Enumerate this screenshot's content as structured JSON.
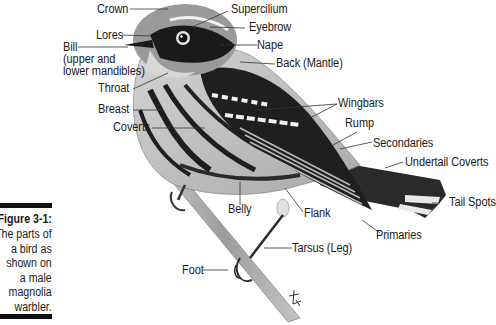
{
  "figure": {
    "caption": {
      "title": "Figure 3-1:",
      "lines": [
        "The parts of",
        "a bird as",
        "shown on",
        "a male",
        "magnolia",
        "warbler."
      ]
    },
    "subject": "male magnolia warbler",
    "labels": {
      "crown": "Crown",
      "supercilium": "Supercilium",
      "lores": "Lores",
      "eyebrow": "Eyebrow",
      "bill": "Bill",
      "bill_detail_1": "(upper and",
      "bill_detail_2": "lower mandibles)",
      "nape": "Nape",
      "back": "Back (Mantle)",
      "throat": "Throat",
      "breast": "Breast",
      "wingbars": "Wingbars",
      "coverts": "Coverts",
      "rump": "Rump",
      "secondaries": "Secondaries",
      "undertail_coverts": "Undertail Coverts",
      "tail_spots": "Tail Spots",
      "belly": "Belly",
      "flank": "Flank",
      "primaries": "Primaries",
      "tarsus": "Tarsus (Leg)",
      "foot": "Foot"
    },
    "signature": "artist signature"
  }
}
